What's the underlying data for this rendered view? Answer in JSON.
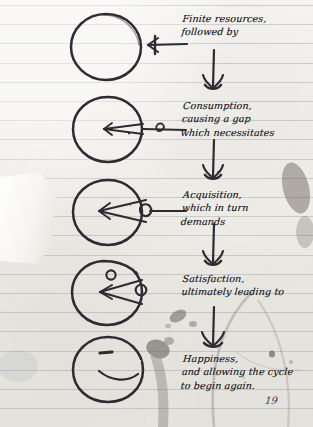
{
  "page": {
    "medium": "ruled-notebook-paper",
    "page_number": "19",
    "ink_color": "#2b2930",
    "rule_color": "#96a0ae",
    "paper_color": "#f0eee9"
  },
  "steps": [
    {
      "id": "finite-resources",
      "text": "Finite resources,\nfollowed by",
      "figure": "full-circle",
      "figure_desc": "whole circle, nothing consumed"
    },
    {
      "id": "consumption",
      "text": "Consumption,\ncausing a gap\nwhich necessitates",
      "figure": "circle-thin-wedge",
      "figure_desc": "circle with a thin wedge removed pointing right"
    },
    {
      "id": "acquisition",
      "text": "Acquisition,\nwhich in turn\ndemands",
      "figure": "circle-wide-wedge",
      "figure_desc": "circle with a wider wedge removed pointing right"
    },
    {
      "id": "satisfaction",
      "text": "Satisfaction,\nultimately leading to",
      "figure": "pacman-with-pellet",
      "figure_desc": "pac-man mouth open with eye dot and a small pellet outside"
    },
    {
      "id": "happiness",
      "text": "Happiness,\nand allowing the cycle\nto begin again.",
      "figure": "smiling-face",
      "figure_desc": "closed circle with eye dash and a smile"
    }
  ],
  "connectors": {
    "horizontal_label": "arrow pointing left from text to figure",
    "vertical_label": "arrow pointing down to the next step"
  }
}
